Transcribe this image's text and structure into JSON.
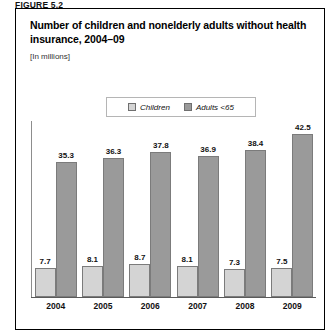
{
  "figure": {
    "caption": "FIGURE 5.2"
  },
  "chart_data": {
    "type": "bar",
    "title": "Number of children and nonelderly adults without health insurance, 2004–09",
    "subtitle": "[In millions]",
    "xlabel": "",
    "ylabel": "",
    "ylim": [
      0,
      46
    ],
    "grid": false,
    "legend_position": "top-center",
    "categories": [
      "2004",
      "2005",
      "2006",
      "2007",
      "2008",
      "2009"
    ],
    "series": [
      {
        "name": "Children",
        "color": "#d4d4d4",
        "values": [
          7.7,
          8.1,
          8.7,
          8.1,
          7.3,
          7.5
        ]
      },
      {
        "name": "Adults <65",
        "color": "#9a9a9a",
        "values": [
          35.3,
          36.3,
          37.8,
          36.9,
          38.4,
          42.5
        ]
      }
    ],
    "value_labels": {
      "children": [
        "7.7",
        "8.1",
        "8.7",
        "8.1",
        "7.3",
        "7.5"
      ],
      "adults": [
        "35.3",
        "36.3",
        "37.8",
        "36.9",
        "38.4",
        "42.5"
      ]
    }
  },
  "legend": {
    "items": [
      {
        "label": "Children",
        "swatch_color": "#d4d4d4"
      },
      {
        "label": "Adults <65",
        "swatch_color": "#9a9a9a"
      }
    ]
  }
}
